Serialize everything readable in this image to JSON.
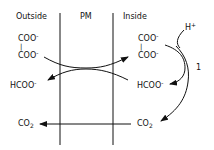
{
  "headers": {
    "outside": "Outside",
    "membrane": "PM",
    "inside": "Inside"
  },
  "outside": {
    "oxalate_top": "COO",
    "oxalate_bond": "|",
    "oxalate_bottom": "COO",
    "charge": "-",
    "formate": "HCOO",
    "co2": "CO",
    "co2_sub": "2"
  },
  "inside": {
    "oxalate_top": "COO",
    "oxalate_bond": "|",
    "oxalate_bottom": "COO",
    "charge": "-",
    "formate": "HCOO",
    "co2": "CO",
    "co2_sub": "2",
    "proton": "H",
    "proton_charge": "+",
    "reaction_label": "1"
  },
  "colors": {
    "line": "#111111",
    "background": "#ffffff"
  }
}
